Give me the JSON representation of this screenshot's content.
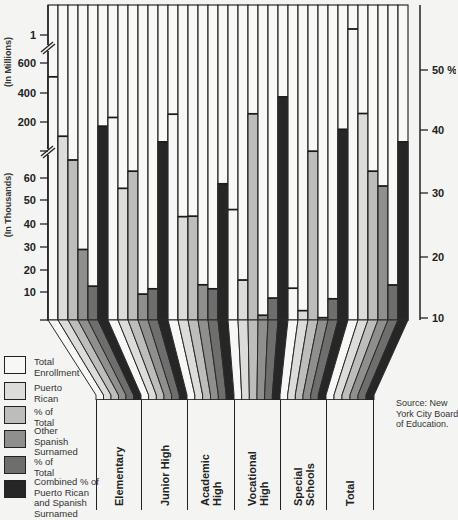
{
  "chart_data": {
    "type": "bar",
    "title": "",
    "xlabel": "",
    "ylabel_left_upper": "(In Millions)",
    "ylabel_left_lower": "(In Thousands)",
    "ylabel_right": "%",
    "left_axis_ticks_millions": [
      "1"
    ],
    "left_axis_ticks_upper_thousands": [
      "600",
      "400",
      "200"
    ],
    "left_axis_ticks_lower_thousands": [
      "60",
      "50",
      "40",
      "30",
      "20",
      "10"
    ],
    "right_axis_ticks": [
      "50 %",
      "40",
      "30",
      "20",
      "10"
    ],
    "right_axis_range": [
      10,
      50
    ],
    "categories": [
      "Elementary",
      "Junior High",
      "Academic High",
      "Vocational High",
      "Special Schools",
      "Total"
    ],
    "series": [
      {
        "name": "Total Enrollment",
        "unit": "thousands",
        "color": "#f7f7f5",
        "values": [
          505,
          228,
          250,
          47,
          13.5,
          1100
        ]
      },
      {
        "name": "Puerto Rican",
        "unit": "thousands",
        "color": "#dcdcda",
        "values": [
          100,
          56,
          44,
          17,
          4,
          255
        ]
      },
      {
        "name": "% of Total (Puerto Rican)",
        "unit": "percent",
        "color": "#bdbdbb",
        "values": [
          35.6,
          33.8,
          26.6,
          43,
          37,
          33.8
        ]
      },
      {
        "name": "Other Spanish Surnamed",
        "unit": "thousands",
        "color": "#8f8f8d",
        "values": [
          30,
          11,
          15,
          2,
          1,
          57
        ]
      },
      {
        "name": "% of Total (Other Spanish Surnamed)",
        "unit": "percent",
        "color": "#6e6e6c",
        "values": [
          15.4,
          15,
          15,
          13.5,
          13.4,
          15.6
        ]
      },
      {
        "name": "Combined % of Puerto Rican and Spanish Surnamed",
        "unit": "percent",
        "color": "#262626",
        "values": [
          41,
          38.5,
          31.8,
          45.7,
          40.5,
          38.5
        ]
      }
    ],
    "grid": false,
    "legend_position": "bottom-left"
  },
  "legend": [
    {
      "label": "Total\nEnrollment",
      "color": "#f7f7f5"
    },
    {
      "label": "Puerto\nRican",
      "color": "#dcdcda"
    },
    {
      "label": "% of\nTotal",
      "color": "#bdbdbb"
    },
    {
      "label": "Other\nSpanish\nSurnamed",
      "color": "#8f8f8d"
    },
    {
      "label": "% of\nTotal",
      "color": "#6e6e6c"
    },
    {
      "label": "Combined % of\nPuerto Rican\nand Spanish\nSurnamed",
      "color": "#262626"
    }
  ],
  "category_labels": [
    "Elementary",
    "Junior High",
    "Academic\nHigh",
    "Vocational\nHigh",
    "Special\nSchools",
    "Total"
  ],
  "axis": {
    "millions_label": "(In Millions)",
    "thousands_label": "(In Thousands)"
  },
  "source": "Source: New\nYork City Board\nof Education."
}
